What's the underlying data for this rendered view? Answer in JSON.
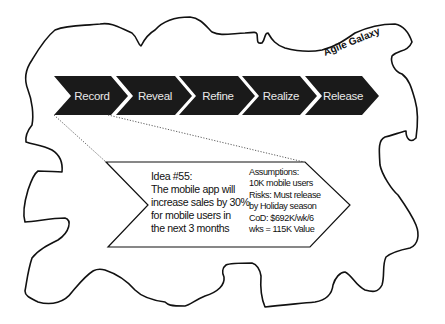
{
  "galaxy": {
    "label": "Agile Galaxy",
    "outline_color": "#111111"
  },
  "process": {
    "fill_color": "#1a1a1a",
    "text_color": "#e8e8e8",
    "steps": [
      {
        "label": "Record"
      },
      {
        "label": "Reveal"
      },
      {
        "label": "Refine"
      },
      {
        "label": "Realize"
      },
      {
        "label": "Release"
      }
    ]
  },
  "idea_card": {
    "title": "Idea #55:",
    "description_lines": [
      "The mobile app will",
      "increase sales by 30%",
      "for mobile users in",
      "the next 3 months"
    ],
    "details_lines": [
      "Assumptions:",
      "10K mobile users",
      "Risks: Must release",
      "by Holiday season",
      "CoD: $692K/wk/6",
      "wks = 115K Value"
    ]
  }
}
